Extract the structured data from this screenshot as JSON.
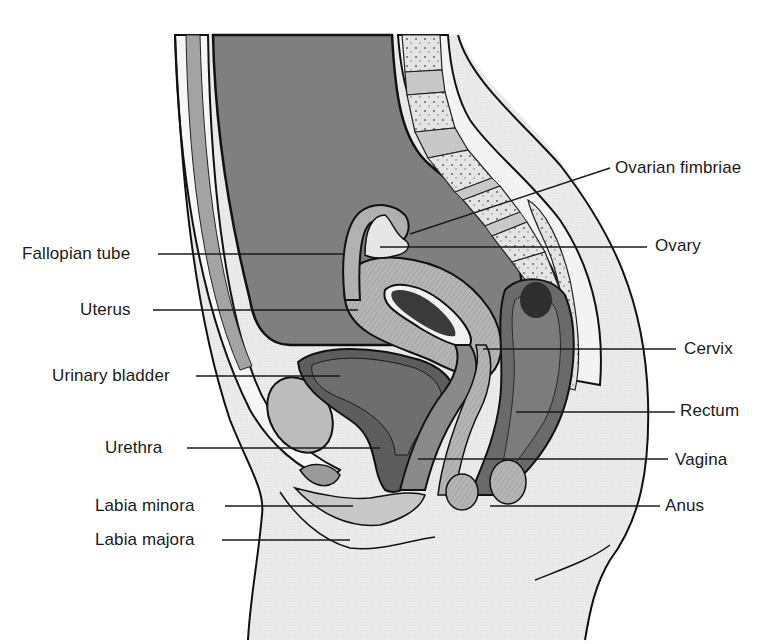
{
  "figure": {
    "colors": {
      "background": "#ffffff",
      "outline": "#111111",
      "abdominal_cavity": "#7d7d7d",
      "muscle_band": "#a8a8a8",
      "fat_tissue": "#f4f4f4",
      "bone": "#dcdcdc",
      "disc": "#c4c4c4",
      "uterus_wall": "#b9b9b9",
      "organ_lining": "#4a4a4a",
      "bladder": "#6e6e6e",
      "rectum": "#767676",
      "skin_stipple": "#e6e6e6",
      "pubic_bone": "#bdbdbd",
      "leader_line": "#1a1a1a"
    },
    "labels_left": [
      {
        "id": "fallopian-tube",
        "text": "Fallopian tube",
        "x": 22,
        "y": 244,
        "line_x1": 158,
        "line_x2": 345,
        "line_y": 254
      },
      {
        "id": "uterus",
        "text": "Uterus",
        "x": 80,
        "y": 300,
        "line_x1": 153,
        "line_x2": 358,
        "line_y": 310
      },
      {
        "id": "urinary-bladder",
        "text": "Urinary bladder",
        "x": 52,
        "y": 366,
        "line_x1": 196,
        "line_x2": 340,
        "line_y": 376
      },
      {
        "id": "urethra",
        "text": "Urethra",
        "x": 105,
        "y": 438,
        "line_x1": 187,
        "line_x2": 380,
        "line_y": 448
      },
      {
        "id": "labia-minora",
        "text": "Labia minora",
        "x": 95,
        "y": 496,
        "line_x1": 225,
        "line_x2": 353,
        "line_y": 506
      },
      {
        "id": "labia-majora",
        "text": "Labia majora",
        "x": 95,
        "y": 530,
        "line_x1": 222,
        "line_x2": 350,
        "line_y": 540
      }
    ],
    "labels_right": [
      {
        "id": "ovarian-fimbriae",
        "text": "Ovarian fimbriae",
        "x": 615,
        "y": 158,
        "line_x1": 410,
        "line_y1": 234,
        "line_x2": 610,
        "line_y2": 168
      },
      {
        "id": "ovary",
        "text": "Ovary",
        "x": 655,
        "y": 236,
        "line_x1": 380,
        "line_x2": 647,
        "line_y": 247
      },
      {
        "id": "cervix",
        "text": "Cervix",
        "x": 684,
        "y": 339,
        "line_x1": 483,
        "line_x2": 676,
        "line_y": 349
      },
      {
        "id": "rectum",
        "text": "Rectum",
        "x": 680,
        "y": 401,
        "line_x1": 516,
        "line_x2": 675,
        "line_y": 412
      },
      {
        "id": "vagina",
        "text": "Vagina",
        "x": 675,
        "y": 450,
        "line_x1": 418,
        "line_x2": 668,
        "line_y": 459
      },
      {
        "id": "anus",
        "text": "Anus",
        "x": 665,
        "y": 496,
        "line_x1": 490,
        "line_x2": 660,
        "line_y": 506
      }
    ]
  }
}
